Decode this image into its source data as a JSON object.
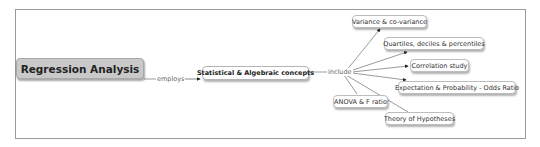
{
  "diagram": {
    "type": "concept-map",
    "root": {
      "label": "Regression Analysis"
    },
    "root_link": {
      "label": "employs"
    },
    "concept": {
      "label": "Statistical & Algebraic concepts"
    },
    "concept_link": {
      "label": "include"
    },
    "children": [
      {
        "label": "Variance & co-variance"
      },
      {
        "label": "Quartiles, deciles & percentiles"
      },
      {
        "label": "Correlation study"
      },
      {
        "label": "Expectation & Probability - Odds Ratio"
      },
      {
        "label": "ANOVA & F ratio"
      },
      {
        "label": "Theory of Hypotheses"
      }
    ],
    "colors": {
      "root_fill": "#c9c9c9",
      "node_fill": "#ffffff",
      "line": "#555555",
      "frame": "#9a9a9a"
    }
  }
}
